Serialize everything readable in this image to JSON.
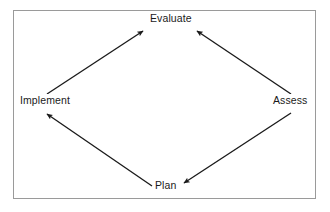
{
  "diagram": {
    "type": "cycle-diagram",
    "background_color": "#ffffff",
    "border_color": "#9a9a9a",
    "line_color": "#1a1a1a",
    "text_color": "#1a1a1a",
    "nodes": [
      {
        "id": "evaluate",
        "label": "Evaluate",
        "position": "top"
      },
      {
        "id": "assess",
        "label": "Assess",
        "position": "right"
      },
      {
        "id": "plan",
        "label": "Plan",
        "position": "bottom"
      },
      {
        "id": "implement",
        "label": "Implement",
        "position": "left"
      }
    ],
    "arrows": [
      {
        "id": "implement-to-evaluate",
        "from": "implement",
        "to": "evaluate",
        "direction": "up-right"
      },
      {
        "id": "assess-to-evaluate",
        "from": "assess",
        "to": "evaluate",
        "direction": "up-left"
      },
      {
        "id": "plan-to-implement",
        "from": "plan",
        "to": "implement",
        "direction": "up-left"
      },
      {
        "id": "assess-to-plan",
        "from": "assess",
        "to": "plan",
        "direction": "down-left"
      }
    ]
  }
}
